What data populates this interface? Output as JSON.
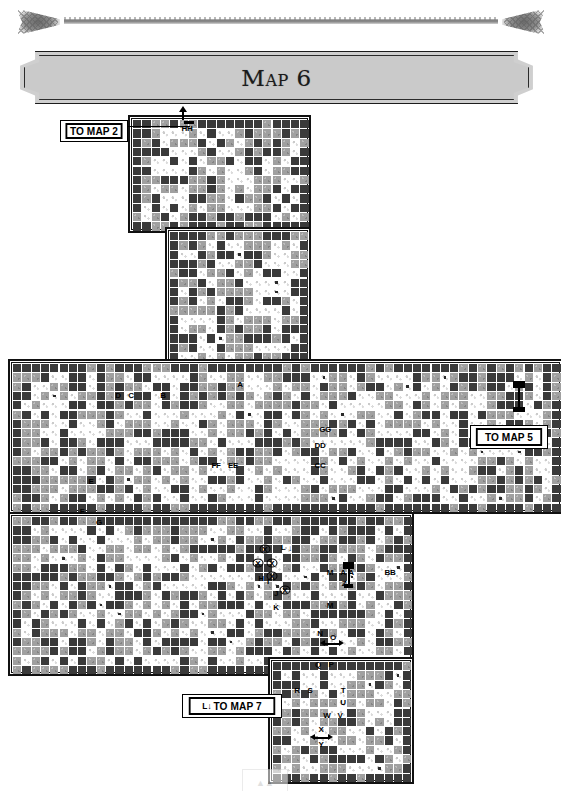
{
  "page": {
    "title": "Map 6",
    "background_color": "#ffffff"
  },
  "header": {
    "banner_title": "Map 6",
    "ornament_name": "decorative-rule"
  },
  "colors": {
    "wall": "#3a3a3a",
    "rock": "#a0a0a0",
    "floor": "#ffffff",
    "outline": "#111111",
    "banner_fill": "#cfcfcf"
  },
  "exits": [
    {
      "id": "to-map-2",
      "prefix": "",
      "label": "TO MAP 2",
      "x": 60,
      "y": 120,
      "w": 68,
      "h": 22
    },
    {
      "id": "to-map-5",
      "prefix": "",
      "label": "TO MAP 5",
      "x": 470,
      "y": 425,
      "w": 78,
      "h": 24
    },
    {
      "id": "to-map-7",
      "prefix": "L↓",
      "label": "TO MAP 7",
      "x": 182,
      "y": 694,
      "w": 100,
      "h": 24
    }
  ],
  "grid": {
    "cell_size": 9.3,
    "gap": 1,
    "legend": {
      "#": "wall",
      "r": "rock",
      ".": "floor",
      "o": "floor-with-dot"
    }
  },
  "sections": [
    {
      "id": "north-chamber",
      "x": 128,
      "y": 3,
      "cols": 19,
      "rows": 12
    },
    {
      "id": "north-corridor",
      "x": 165,
      "y": 115,
      "cols": 15,
      "rows": 16
    },
    {
      "id": "central-hall",
      "x": 8,
      "y": 247,
      "cols": 59,
      "rows": 16
    },
    {
      "id": "west-hall",
      "x": 8,
      "y": 400,
      "cols": 43,
      "rows": 17
    },
    {
      "id": "south-shaft",
      "x": 268,
      "y": 545,
      "cols": 15,
      "rows": 13
    }
  ],
  "room_labels": [
    {
      "text": "HH",
      "x": 187,
      "y": 129
    },
    {
      "text": "A",
      "x": 240,
      "y": 385
    },
    {
      "text": "B",
      "x": 163,
      "y": 396
    },
    {
      "text": "C",
      "x": 131,
      "y": 396
    },
    {
      "text": "D",
      "x": 118,
      "y": 396
    },
    {
      "text": "GG",
      "x": 325,
      "y": 430
    },
    {
      "text": "DD",
      "x": 320,
      "y": 446
    },
    {
      "text": "CC",
      "x": 320,
      "y": 466
    },
    {
      "text": "FF",
      "x": 216,
      "y": 466
    },
    {
      "text": "EE",
      "x": 233,
      "y": 466
    },
    {
      "text": "E",
      "x": 91,
      "y": 482
    },
    {
      "text": "F",
      "x": 82,
      "y": 512
    },
    {
      "text": "G",
      "x": 99,
      "y": 523
    },
    {
      "text": "L",
      "x": 283,
      "y": 548
    },
    {
      "text": "H",
      "x": 261,
      "y": 579
    },
    {
      "text": "I",
      "x": 268,
      "y": 582
    },
    {
      "text": "J",
      "x": 276,
      "y": 594
    },
    {
      "text": "K",
      "x": 276,
      "y": 608
    },
    {
      "text": "M",
      "x": 330,
      "y": 573
    },
    {
      "text": "A",
      "x": 343,
      "y": 573
    },
    {
      "text": "A",
      "x": 351,
      "y": 573
    },
    {
      "text": "Z",
      "x": 344,
      "y": 584
    },
    {
      "text": "BB",
      "x": 390,
      "y": 573
    },
    {
      "text": "M",
      "x": 330,
      "y": 606
    },
    {
      "text": "N",
      "x": 320,
      "y": 634
    },
    {
      "text": "O",
      "x": 333,
      "y": 638
    },
    {
      "text": "Q",
      "x": 318,
      "y": 665
    },
    {
      "text": "P",
      "x": 331,
      "y": 665
    },
    {
      "text": "R",
      "x": 297,
      "y": 691
    },
    {
      "text": "S",
      "x": 310,
      "y": 691
    },
    {
      "text": "T",
      "x": 343,
      "y": 691
    },
    {
      "text": "U",
      "x": 343,
      "y": 703
    },
    {
      "text": "W",
      "x": 327,
      "y": 716
    },
    {
      "text": "V",
      "x": 340,
      "y": 716
    },
    {
      "text": "X",
      "x": 321,
      "y": 730
    },
    {
      "text": "Y",
      "x": 321,
      "y": 745
    }
  ],
  "x_markers": [
    {
      "x": 265,
      "y": 549
    },
    {
      "x": 258,
      "y": 563
    },
    {
      "x": 272,
      "y": 563
    },
    {
      "x": 272,
      "y": 576
    },
    {
      "x": 285,
      "y": 590
    }
  ],
  "footer": {
    "marker_label": "▲▲"
  }
}
